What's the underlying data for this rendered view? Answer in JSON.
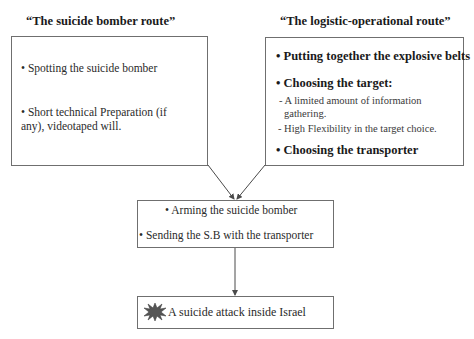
{
  "diagram": {
    "left_route": {
      "title": "“The suicide bomber route”",
      "items": [
        "• Spotting the suicide bomber",
        "• Short technical Preparation (if",
        "any), videotaped will."
      ]
    },
    "right_route": {
      "title": "“The logistic-operational route”",
      "items": [
        "• Putting together the explosive belts",
        "• Choosing the target:",
        "- A limited amount of information",
        "gathering.",
        "- High Flexibility in the target choice.",
        "• Choosing the transporter"
      ]
    },
    "merge_box": {
      "items": [
        "• Arming the suicide bomber",
        "• Sending the S.B with the transporter"
      ]
    },
    "outcome_box": {
      "icon": "explosion-icon",
      "label": "A suicide attack inside Israel"
    },
    "colors": {
      "border": "#6f6f6f",
      "arrow": "#4a4a4a",
      "explosion": "#555555"
    }
  }
}
